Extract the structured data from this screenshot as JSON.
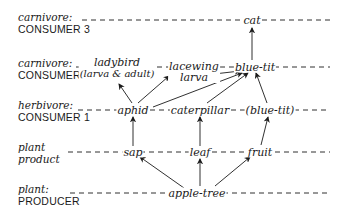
{
  "diagram": {
    "type": "food-web",
    "levels": [
      {
        "id": "c3",
        "line1": "carnivore:",
        "line2": "CONSUMER 3"
      },
      {
        "id": "c2",
        "line1": "carnivore:",
        "line2": "CONSUMER 2"
      },
      {
        "id": "c1",
        "line1": "herbivore:",
        "line2": "CONSUMER 1"
      },
      {
        "id": "pp",
        "line1": "plant",
        "line2": "product"
      },
      {
        "id": "pr",
        "line1": "plant:",
        "line2": "PRODUCER"
      }
    ],
    "nodes": {
      "cat": "cat",
      "ladybird_1": "ladybird",
      "ladybird_2": "(larva & adult)",
      "lacewing_1": "lacewing",
      "lacewing_2": "larva",
      "bluetit": "blue-tit",
      "aphid": "aphid",
      "caterpillar": "caterpillar",
      "bluetit_paren": "(blue-tit)",
      "sap": "sap",
      "leaf": "leaf",
      "fruit": "fruit",
      "appletree": "apple-tree"
    },
    "edges": [
      {
        "from": "apple-tree",
        "to": "sap"
      },
      {
        "from": "apple-tree",
        "to": "leaf"
      },
      {
        "from": "apple-tree",
        "to": "fruit"
      },
      {
        "from": "sap",
        "to": "aphid"
      },
      {
        "from": "leaf",
        "to": "caterpillar"
      },
      {
        "from": "fruit",
        "to": "(blue-tit)"
      },
      {
        "from": "aphid",
        "to": "ladybird (larva & adult)"
      },
      {
        "from": "aphid",
        "to": "lacewing larva"
      },
      {
        "from": "aphid",
        "to": "blue-tit"
      },
      {
        "from": "caterpillar",
        "to": "blue-tit"
      },
      {
        "from": "(blue-tit)",
        "to": "blue-tit"
      },
      {
        "from": "lacewing larva",
        "to": "blue-tit"
      },
      {
        "from": "blue-tit",
        "to": "cat"
      }
    ]
  }
}
